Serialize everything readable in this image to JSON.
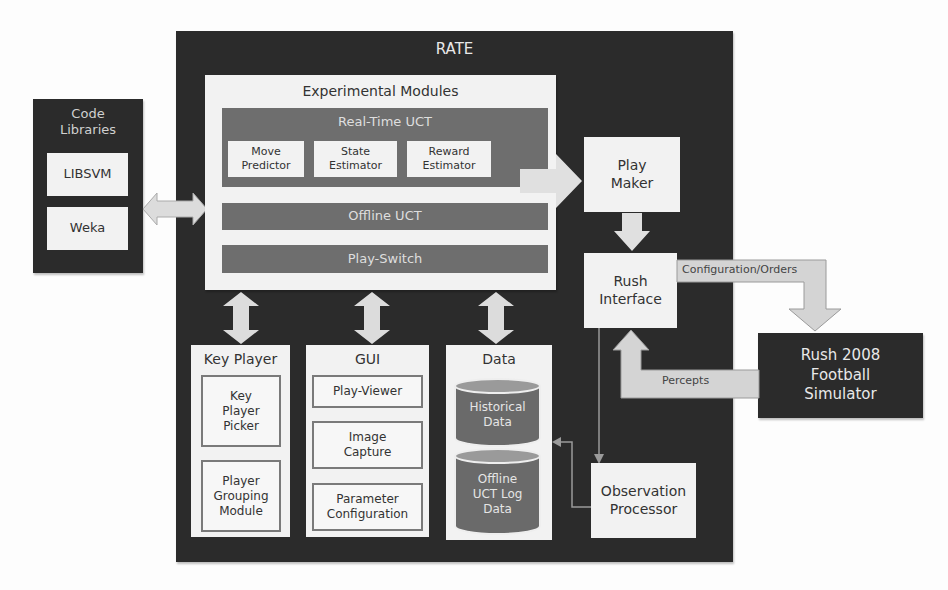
{
  "rate": {
    "title": "RATE"
  },
  "code_libraries": {
    "title_line1": "Code",
    "title_line2": "Libraries",
    "items": [
      "LIBSVM",
      "Weka"
    ]
  },
  "experimental_modules": {
    "title": "Experimental Modules",
    "real_time_uct": {
      "title": "Real-Time UCT",
      "components": [
        {
          "line1": "Move",
          "line2": "Predictor"
        },
        {
          "line1": "State",
          "line2": "Estimator"
        },
        {
          "line1": "Reward",
          "line2": "Estimator"
        }
      ]
    },
    "offline_uct": "Offline UCT",
    "play_switch": "Play-Switch"
  },
  "play_maker": {
    "line1": "Play",
    "line2": "Maker"
  },
  "rush_interface": {
    "line1": "Rush",
    "line2": "Interface"
  },
  "key_player": {
    "title": "Key Player",
    "picker": {
      "line1": "Key",
      "line2": "Player",
      "line3": "Picker"
    },
    "grouping": {
      "line1": "Player",
      "line2": "Grouping",
      "line3": "Module"
    }
  },
  "gui": {
    "title": "GUI",
    "play_viewer": "Play-Viewer",
    "image_capture": {
      "line1": "Image",
      "line2": "Capture"
    },
    "parameter_config": {
      "line1": "Parameter",
      "line2": "Configuration"
    }
  },
  "data": {
    "title": "Data",
    "historical": {
      "line1": "Historical",
      "line2": "Data"
    },
    "offline_log": {
      "line1": "Offline",
      "line2": "UCT Log",
      "line3": "Data"
    }
  },
  "observation_processor": {
    "line1": "Observation",
    "line2": "Processor"
  },
  "simulator": {
    "line1": "Rush 2008",
    "line2": "Football",
    "line3": "Simulator"
  },
  "arrows": {
    "config_orders": "Configuration/Orders",
    "percepts": "Percepts"
  },
  "colors": {
    "dark_bg": "#2b2b2b",
    "panel_light": "#f2f2f2",
    "module_mid": "#6e6e6e",
    "arrow_fill": "#d9d9d9"
  }
}
